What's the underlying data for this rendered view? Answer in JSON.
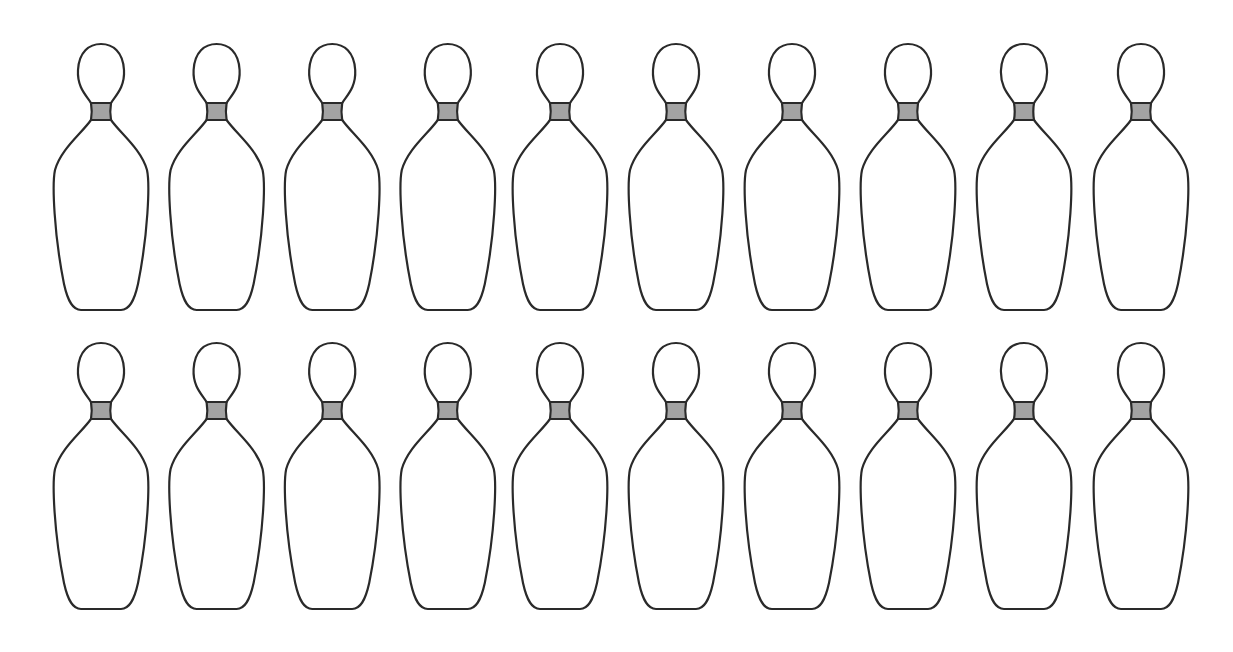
{
  "figure": {
    "rows": 2,
    "columns": 10,
    "total_pins": 20,
    "row_top_y": [
      44,
      343
    ],
    "first_center_x": 101,
    "spacing_x": 115.6
  },
  "colors": {
    "background": "#ffffff",
    "outline": "#2a2a2a",
    "body_fill": "#ffffff",
    "neck_band": "#a3a3a3"
  }
}
